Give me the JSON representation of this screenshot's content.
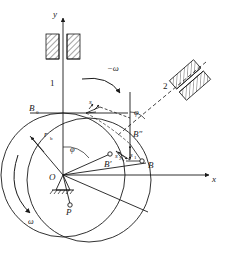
{
  "figure": {
    "type": "engineering-diagram",
    "background_color": "#ffffff",
    "line_color": "#1a1a1a",
    "width": 229,
    "height": 253
  },
  "axes": {
    "x_label": "x",
    "y_label": "y",
    "origin_label": "O"
  },
  "labels": {
    "link1": "1",
    "link2": "2",
    "omega_negative": "−ω",
    "omega": "ω",
    "base_radius": "r",
    "base_radius_sub": "b",
    "phi_origin": "φ",
    "phi_upper": "φ",
    "point_B0": "B",
    "point_B0_sub": "0",
    "point_B_prime": "B′",
    "point_B_double_prime": "B″",
    "point_B": "B",
    "point_P": "P",
    "displacement_s": "s",
    "displacement_s1": "s",
    "displacement_s1_sub": "1",
    "displacement_s2": "s",
    "displacement_s2_sub": "2"
  },
  "geometry": {
    "origin": {
      "x": 63,
      "y": 175
    },
    "x_axis_end": {
      "x": 213,
      "y": 175
    },
    "y_axis_top": {
      "x": 63,
      "y": 14
    },
    "base_circle": {
      "cx": 63,
      "cy": 175,
      "r": 62
    },
    "displaced_circle": {
      "cx": 88,
      "cy": 180,
      "r": 62
    },
    "point_B0": {
      "x": 63,
      "y": 113
    },
    "point_B_prime": {
      "x": 110,
      "y": 155
    },
    "point_B_double_prime": {
      "x": 135,
      "y": 140
    },
    "point_B": {
      "x": 142,
      "y": 163
    },
    "point_P": {
      "x": 70,
      "y": 205
    },
    "guide_block_vertical": {
      "x": 48,
      "y": 37,
      "w": 30,
      "h": 22
    },
    "guide_block_slanted_angle_deg": -40
  }
}
